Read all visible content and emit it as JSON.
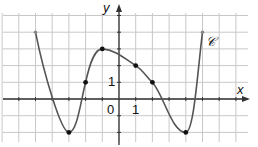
{
  "figure": {
    "curve_label": "𝒞",
    "x_axis_label": "x",
    "y_axis_label": "y",
    "origin_label": "0",
    "x_unit_label": "1",
    "y_unit_label": "1"
  },
  "graph": {
    "origin_px": [
      119,
      99
    ],
    "unit_px": 16.7,
    "x_range": [
      -7,
      7.5
    ],
    "y_range": [
      -2.5,
      5.2
    ],
    "key_points": [
      {
        "x": -5,
        "y": 4,
        "style": "endpoint"
      },
      {
        "x": -3,
        "y": -2,
        "style": "dot"
      },
      {
        "x": -2,
        "y": 1,
        "style": "dot"
      },
      {
        "x": -1,
        "y": 3,
        "style": "dot"
      },
      {
        "x": 1,
        "y": 2,
        "style": "dot"
      },
      {
        "x": 2,
        "y": 1,
        "style": "dot"
      },
      {
        "x": 4,
        "y": -2,
        "style": "dot"
      },
      {
        "x": 5,
        "y": 4,
        "style": "endpoint"
      }
    ],
    "colors": {
      "grid": "#c8c8c8",
      "axis": "#333333",
      "curve": "#555555",
      "dot": "#111111"
    }
  }
}
